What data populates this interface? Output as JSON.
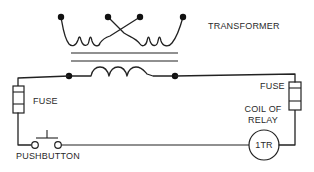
{
  "diagram": {
    "colors": {
      "line": "#222222",
      "background": "#ffffff",
      "text": "#2a2a2a"
    },
    "labels": {
      "transformer": "TRANSFORMER",
      "fuse_left": "FUSE",
      "fuse_right": "FUSE",
      "coil_line1": "COIL OF",
      "coil_line2": "RELAY",
      "relay_id": "1TR",
      "pushbutton": "PUSHBUTTON"
    },
    "components": [
      {
        "type": "transformer",
        "label": "TRANSFORMER",
        "primary_terminals": 4,
        "crossed_inner_leads": true,
        "core_lines": 2
      },
      {
        "type": "fuse",
        "label": "FUSE",
        "position": "left"
      },
      {
        "type": "fuse",
        "label": "FUSE",
        "position": "right"
      },
      {
        "type": "pushbutton",
        "label": "PUSHBUTTON",
        "state": "normally-open"
      },
      {
        "type": "relay-coil",
        "label": "COIL OF RELAY",
        "id": "1TR"
      }
    ]
  }
}
